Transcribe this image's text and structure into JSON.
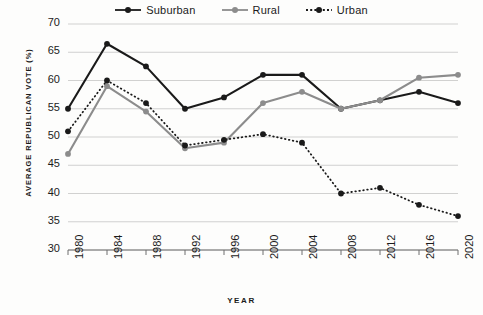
{
  "chart_data": {
    "type": "line",
    "title": "",
    "xlabel": "YEAR",
    "ylabel": "AVERAGE REPUBLICAN VOTE (%)",
    "categories": [
      "1980",
      "1984",
      "1988",
      "1992",
      "1996",
      "2000",
      "2004",
      "2008",
      "2012",
      "2016",
      "2020"
    ],
    "x": [
      1980,
      1984,
      1988,
      1992,
      1996,
      2000,
      2004,
      2008,
      2012,
      2016,
      2020
    ],
    "ylim": [
      30,
      70
    ],
    "yticks": [
      30,
      35,
      40,
      45,
      50,
      55,
      60,
      65,
      70
    ],
    "grid": true,
    "legend_position": "top-center",
    "series": [
      {
        "name": "Suburban",
        "color": "#1a1a1a",
        "style": "solid",
        "values": [
          55.0,
          66.5,
          62.5,
          55.0,
          57.0,
          61.0,
          61.0,
          55.0,
          56.5,
          58.0,
          56.0
        ]
      },
      {
        "name": "Rural",
        "color": "#8c8c8c",
        "style": "solid",
        "values": [
          47.0,
          59.0,
          54.5,
          48.0,
          49.0,
          56.0,
          58.0,
          55.0,
          56.5,
          60.5,
          61.0
        ]
      },
      {
        "name": "Urban",
        "color": "#1a1a1a",
        "style": "dotted",
        "values": [
          51.0,
          60.0,
          56.0,
          48.5,
          49.5,
          50.5,
          49.0,
          40.0,
          41.0,
          38.0,
          36.0
        ]
      }
    ]
  },
  "legend": {
    "items": [
      {
        "label": "Suburban"
      },
      {
        "label": "Rural"
      },
      {
        "label": "Urban"
      }
    ]
  },
  "axes": {
    "y_title": "AVERAGE REPUBLICAN VOTE (%)",
    "x_title": "YEAR"
  }
}
